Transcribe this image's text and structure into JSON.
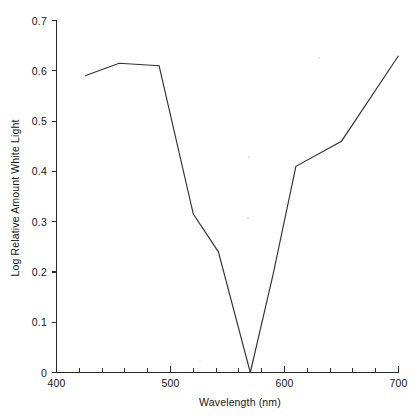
{
  "chart_data": {
    "type": "line",
    "title": "",
    "xlabel": "Wavelength (nm)",
    "ylabel": "Log Relative Amount White Light",
    "xlim": [
      400,
      700
    ],
    "ylim": [
      0,
      0.7
    ],
    "grid": false,
    "legend": null,
    "x_major_ticks": [
      400,
      500,
      600,
      700
    ],
    "x_major_tick_labels": [
      "400",
      "500",
      "600",
      "700"
    ],
    "x_minor_tick_interval": 20,
    "y_major_ticks": [
      0,
      0.1,
      0.2,
      0.3,
      0.4,
      0.5,
      0.6,
      0.7
    ],
    "y_major_tick_labels": [
      "0",
      "0.1",
      "0.2",
      "0.3",
      "0.4",
      "0.5",
      "0.6",
      "0.7"
    ],
    "series": [
      {
        "name": "Transmission spectrum",
        "x": [
          425,
          455,
          490,
          520,
          542,
          570,
          590,
          610,
          650,
          700
        ],
        "values": [
          0.59,
          0.615,
          0.61,
          0.315,
          0.24,
          0.0,
          0.195,
          0.41,
          0.46,
          0.63
        ]
      }
    ]
  },
  "axes": {
    "x_title": "Wavelength (nm)",
    "y_title": "Log Relative Amount White Light",
    "x_labels": [
      "400",
      "500",
      "600",
      "700"
    ],
    "y_labels": [
      "0.7",
      "0.6",
      "0.5",
      "0.4",
      "0.3",
      "0.2",
      "0.1",
      "0"
    ]
  },
  "colors": {
    "line": "#333333",
    "axis": "#2a2a2a",
    "background": "#ffffff",
    "text": "#161616"
  }
}
